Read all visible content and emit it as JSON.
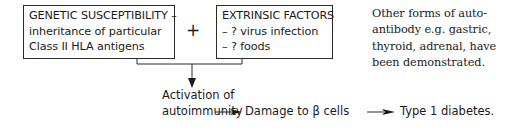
{
  "diagram": {
    "genetic_box": {
      "lines": [
        "GENETIC SUSCEPTIBILITY –",
        "inheritance of particular",
        "Class II HLA antigens"
      ]
    },
    "operator": "+",
    "extrinsic_box": {
      "lines": [
        "EXTRINSIC FACTORS",
        "– ? virus infection",
        "– ? foods"
      ]
    },
    "side_note": {
      "lines": [
        "Other forms of auto-",
        "antibody e.g. gastric,",
        "thyroid, adrenal, have",
        "been demonstrated."
      ]
    },
    "activation": {
      "lines": [
        "Activation of",
        "autoimmunity"
      ]
    },
    "damage": "Damage to β cells",
    "outcome": "Type 1 diabetes.",
    "icons": {
      "down_arrow": "arrow-down",
      "right_arrow": "arrow-right"
    },
    "colors": {
      "line": "#2a2a2a",
      "text": "#1a1a1a",
      "background": "#ffffff"
    }
  }
}
